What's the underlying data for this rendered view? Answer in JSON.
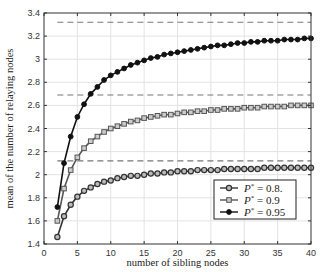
{
  "chart_data": {
    "type": "line",
    "title": "",
    "xlabel": "number  of  sibling nodes",
    "ylabel": "mean of the number of relaying nodes",
    "xlim": [
      0,
      40
    ],
    "ylim": [
      1.4,
      3.4
    ],
    "xticks": [
      0,
      5,
      10,
      15,
      20,
      25,
      30,
      35,
      40
    ],
    "yticks": [
      1.4,
      1.6,
      1.8,
      2,
      2.2,
      2.4,
      2.6,
      2.8,
      3,
      3.2,
      3.4
    ],
    "grid": true,
    "legend_position": "lower right",
    "x": [
      2,
      3,
      4,
      5,
      6,
      7,
      8,
      9,
      10,
      11,
      12,
      13,
      14,
      15,
      16,
      17,
      18,
      19,
      20,
      21,
      22,
      23,
      24,
      25,
      26,
      27,
      28,
      29,
      30,
      31,
      32,
      33,
      34,
      35,
      36,
      37,
      38,
      39,
      40
    ],
    "series": [
      {
        "name": "P* = 0.8",
        "marker": "circle-open",
        "color": "#333333",
        "values": [
          1.46,
          1.64,
          1.74,
          1.81,
          1.86,
          1.89,
          1.92,
          1.94,
          1.95,
          1.97,
          1.98,
          1.99,
          1.99,
          2.0,
          2.01,
          2.01,
          2.02,
          2.02,
          2.03,
          2.03,
          2.03,
          2.04,
          2.04,
          2.04,
          2.04,
          2.05,
          2.05,
          2.05,
          2.05,
          2.05,
          2.05,
          2.06,
          2.06,
          2.06,
          2.06,
          2.06,
          2.06,
          2.06,
          2.06
        ]
      },
      {
        "name": "P* = 0.9",
        "marker": "square-open",
        "color": "#555555",
        "values": [
          1.6,
          1.88,
          2.04,
          2.15,
          2.23,
          2.29,
          2.33,
          2.37,
          2.4,
          2.42,
          2.44,
          2.46,
          2.47,
          2.49,
          2.5,
          2.51,
          2.52,
          2.52,
          2.53,
          2.54,
          2.54,
          2.55,
          2.55,
          2.56,
          2.56,
          2.57,
          2.57,
          2.57,
          2.58,
          2.58,
          2.58,
          2.59,
          2.59,
          2.59,
          2.59,
          2.6,
          2.6,
          2.6,
          2.6
        ]
      },
      {
        "name": "P* = 0.95",
        "marker": "circle-filled",
        "color": "#111111",
        "values": [
          1.72,
          2.1,
          2.33,
          2.5,
          2.61,
          2.7,
          2.76,
          2.82,
          2.86,
          2.89,
          2.92,
          2.95,
          2.97,
          2.99,
          3.01,
          3.02,
          3.04,
          3.05,
          3.06,
          3.07,
          3.08,
          3.09,
          3.1,
          3.11,
          3.12,
          3.12,
          3.13,
          3.14,
          3.14,
          3.15,
          3.15,
          3.16,
          3.16,
          3.16,
          3.17,
          3.17,
          3.17,
          3.18,
          3.18
        ]
      }
    ],
    "asymptotes": [
      {
        "series": "P* = 0.8",
        "y": 2.12,
        "x_start": 2,
        "x_end": 40,
        "style": "dashed"
      },
      {
        "series": "P* = 0.9",
        "y": 2.69,
        "x_start": 2,
        "x_end": 40,
        "style": "dashed"
      },
      {
        "series": "P* = 0.95",
        "y": 3.32,
        "x_start": 2,
        "x_end": 40,
        "style": "dashed"
      }
    ]
  },
  "legend": {
    "items": [
      {
        "label": "P* = 0.8",
        "sym": "P",
        "sup": "*",
        "value": " = 0.8."
      },
      {
        "label": "P* = 0.9",
        "sym": "P",
        "sup": "*",
        "value": " = 0.9"
      },
      {
        "label": "P* = 0.95",
        "sym": "P",
        "sup": "*",
        "value": " = 0.95"
      }
    ]
  }
}
